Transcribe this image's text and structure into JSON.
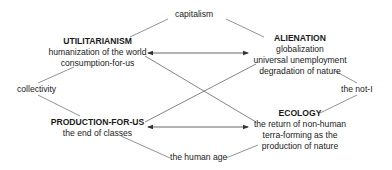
{
  "nodes": {
    "utilitarianism": {
      "title": "UTILITARIANISM",
      "lines": [
        "humanization of the world",
        "consumption-for-us"
      ]
    },
    "alienation": {
      "title": "ALIENATION",
      "lines": [
        "globalization",
        "universal unemployment",
        "degradation of nature"
      ]
    },
    "production": {
      "title": "PRODUCTION-FOR-US",
      "lines": [
        "the end of classes"
      ]
    },
    "ecology": {
      "title": "ECOLOGY",
      "lines": [
        "the return of non-human",
        "terra-forming as the",
        "production of nature"
      ]
    }
  },
  "terms": {
    "top": "capitalism",
    "left": "collectivity",
    "right": "the not-I",
    "bottom": "the human age"
  },
  "colors": {
    "line": "#555555",
    "text": "#1a1a1a"
  }
}
